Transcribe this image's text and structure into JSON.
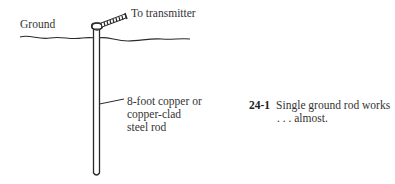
{
  "figure": {
    "number": "24-1",
    "caption_line1": "Single ground rod works",
    "caption_line2": ". . . almost."
  },
  "labels": {
    "ground": "Ground",
    "transmitter": "To transmitter",
    "rod_line1": "8-foot copper or",
    "rod_line2": "copper-clad",
    "rod_line3": "steel rod"
  },
  "colors": {
    "ink": "#2a2a2a",
    "background": "#ffffff"
  }
}
